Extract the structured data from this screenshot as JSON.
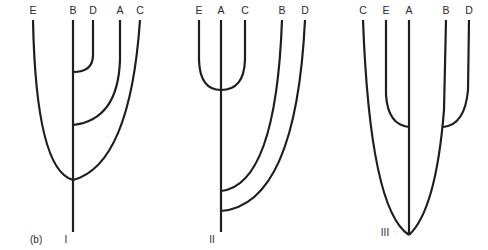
{
  "figure": {
    "panel_label": "(b)",
    "stroke_color": "#1e1e1e",
    "text_color": "#2a2a2a",
    "trees": [
      {
        "id": "I",
        "label": "I",
        "tips": [
          {
            "name": "E",
            "x": 33
          },
          {
            "name": "B",
            "x": 73
          },
          {
            "name": "D",
            "x": 93
          },
          {
            "name": "A",
            "x": 120
          },
          {
            "name": "C",
            "x": 140
          }
        ],
        "topology": "((((B,D),A),(E,C)))",
        "description": "D joins B first, then A joins B lineage, then E and C join at root node on B stem"
      },
      {
        "id": "II",
        "label": "II",
        "tips": [
          {
            "name": "E",
            "x": 199
          },
          {
            "name": "A",
            "x": 221
          },
          {
            "name": "C",
            "x": 245
          },
          {
            "name": "B",
            "x": 282
          },
          {
            "name": "D",
            "x": 305
          }
        ],
        "topology": "((((E,A,C),B),D))",
        "description": "E and C join A in a trichotomy, then B joins, then D joins near root"
      },
      {
        "id": "III",
        "label": "III",
        "tips": [
          {
            "name": "C",
            "x": 363
          },
          {
            "name": "E",
            "x": 386
          },
          {
            "name": "A",
            "x": 409
          },
          {
            "name": "B",
            "x": 446
          },
          {
            "name": "D",
            "x": 469
          }
        ],
        "topology": "(C,(E,A),(B,D))",
        "description": "E joins A, D joins B, then C, (E,A) and (B,D) converge at root"
      }
    ]
  }
}
